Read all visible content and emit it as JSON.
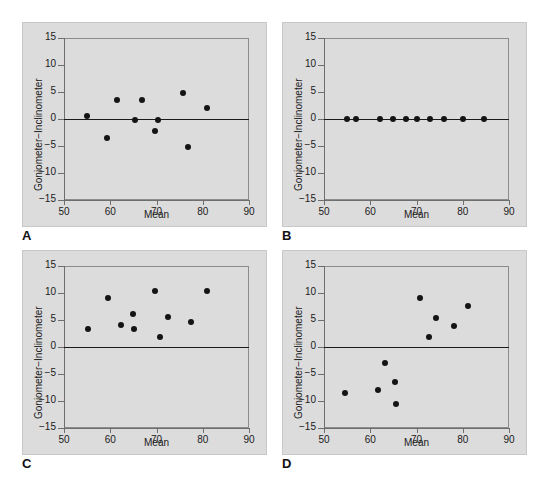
{
  "figure": {
    "background": "#ffffff",
    "panel_background": "#dcdcdc",
    "point_color": "#141414",
    "zero_line_color": "#1a1a1a",
    "axis_color": "#6e6e6e"
  },
  "axes": {
    "xlabel": "Mean",
    "ylabel": "Goniometer−Inclinometer",
    "xlim": [
      50,
      90
    ],
    "ylim": [
      -15,
      15
    ],
    "xticks": [
      50,
      60,
      70,
      80,
      90
    ],
    "yticks": [
      15,
      10,
      5,
      0,
      -5,
      -10,
      -15
    ],
    "xticklabels": [
      "50",
      "60",
      "70",
      "80",
      "90"
    ],
    "yticklabels": [
      "15",
      "10",
      "5",
      "0",
      "−5",
      "−10",
      "−15"
    ],
    "grid": false,
    "reference_line_y": 0
  },
  "panels": [
    {
      "letter": "A",
      "id": "panel-a"
    },
    {
      "letter": "B",
      "id": "panel-b"
    },
    {
      "letter": "C",
      "id": "panel-c"
    },
    {
      "letter": "D",
      "id": "panel-d"
    }
  ],
  "chart_data": [
    {
      "type": "scatter",
      "panel": "A",
      "title": "",
      "xlabel": "Mean",
      "ylabel": "Goniometer−Inclinometer",
      "xlim": [
        50,
        90
      ],
      "ylim": [
        -15,
        15
      ],
      "grid": false,
      "reference_line_y": 0,
      "x": [
        55.0,
        59.4,
        61.5,
        65.3,
        66.8,
        69.6,
        70.4,
        75.8,
        76.9,
        81.0
      ],
      "y": [
        0.5,
        -3.6,
        3.5,
        -0.1,
        3.5,
        -2.3,
        -0.1,
        4.9,
        -5.1,
        2.0
      ]
    },
    {
      "type": "scatter",
      "panel": "B",
      "title": "",
      "xlabel": "Mean",
      "ylabel": "Goniometer−Inclinometer",
      "xlim": [
        50,
        90
      ],
      "ylim": [
        -15,
        15
      ],
      "grid": false,
      "reference_line_y": 0,
      "x": [
        55.0,
        57.0,
        62.2,
        65.0,
        67.7,
        70.0,
        73.0,
        76.0,
        80.0,
        84.5
      ],
      "y": [
        0,
        0,
        0,
        0,
        0,
        0,
        0,
        0,
        0,
        0
      ]
    },
    {
      "type": "scatter",
      "panel": "C",
      "title": "",
      "xlabel": "Mean",
      "ylabel": "Goniometer−Inclinometer",
      "xlim": [
        50,
        90
      ],
      "ylim": [
        -15,
        15
      ],
      "grid": false,
      "reference_line_y": 0,
      "x": [
        55.1,
        59.5,
        62.3,
        65.0,
        65.2,
        69.6,
        70.8,
        72.4,
        77.5,
        81.0
      ],
      "y": [
        3.3,
        9.0,
        4.0,
        6.2,
        3.3,
        10.3,
        1.8,
        5.5,
        4.7,
        10.3
      ]
    },
    {
      "type": "scatter",
      "panel": "D",
      "title": "",
      "xlabel": "Mean",
      "ylabel": "Goniometer−Inclinometer",
      "xlim": [
        50,
        90
      ],
      "ylim": [
        -15,
        15
      ],
      "grid": false,
      "reference_line_y": 0,
      "x": [
        54.6,
        61.7,
        63.2,
        65.3,
        65.5,
        70.7,
        72.6,
        74.2,
        78.1,
        81.2
      ],
      "y": [
        -8.5,
        -7.9,
        -3.0,
        -6.5,
        -10.6,
        9.0,
        1.8,
        5.4,
        3.9,
        7.6
      ]
    }
  ]
}
